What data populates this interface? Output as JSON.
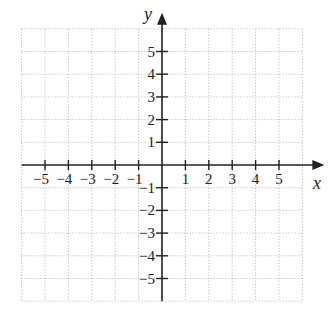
{
  "chart_data": {
    "type": "scatter",
    "title": "",
    "xlabel": "x",
    "ylabel": "y",
    "xlim": [
      -6,
      6
    ],
    "ylim": [
      -6,
      6
    ],
    "grid": true,
    "grid_style": "dotted",
    "x_ticks": [
      -5,
      -4,
      -3,
      -2,
      -1,
      1,
      2,
      3,
      4,
      5
    ],
    "y_ticks": [
      -5,
      -4,
      -3,
      -2,
      -1,
      1,
      2,
      3,
      4,
      5
    ],
    "x_tick_labels": [
      "−5",
      "−4",
      "−3",
      "−2",
      "−1",
      "1",
      "2",
      "3",
      "4",
      "5"
    ],
    "y_tick_labels": [
      "−5",
      "−4",
      "−3",
      "−2",
      "−1",
      "1",
      "2",
      "3",
      "4",
      "5"
    ],
    "series": [],
    "colors": {
      "axis": "#222222",
      "grid": "#b0b0b0"
    }
  }
}
